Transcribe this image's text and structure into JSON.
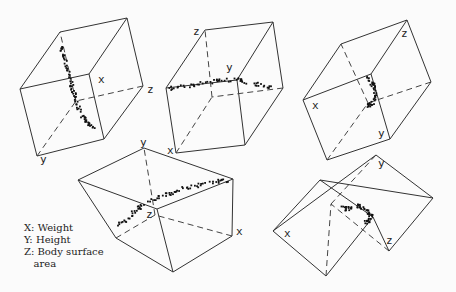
{
  "legend": {
    "x": "X: Weight",
    "y": "Y: Height",
    "z": "Z: Body surface",
    "z_cont": "   area"
  },
  "chart_data": {
    "type": "scatter",
    "title": "",
    "axes": {
      "x": "Weight",
      "y": "Height",
      "z": "Body surface area"
    },
    "legend_position": "lower-left",
    "grid": false,
    "views": [
      {
        "id": "top-left",
        "labels": {
          "x": "x",
          "y": "y",
          "z": "z"
        },
        "front": [
          [
            20,
            89
          ],
          [
            89,
            74
          ],
          [
            104,
            139
          ],
          [
            37,
            156
          ]
        ],
        "back": [
          [
            60,
            32
          ],
          [
            127,
            18
          ],
          [
            143,
            86
          ],
          [
            76,
            101
          ]
        ],
        "label_pos": {
          "x": [
            98,
            83
          ],
          "z": [
            147,
            93
          ],
          "y": [
            40,
            163
          ]
        },
        "points_path": [
          [
            60,
            46
          ],
          [
            62,
            52
          ],
          [
            64,
            60
          ],
          [
            67,
            70
          ],
          [
            70,
            80
          ],
          [
            72,
            88
          ],
          [
            74,
            96
          ],
          [
            77,
            104
          ],
          [
            80,
            112
          ],
          [
            84,
            118
          ],
          [
            88,
            124
          ],
          [
            94,
            128
          ]
        ]
      },
      {
        "id": "top-center",
        "labels": {
          "x": "x",
          "y": "y",
          "z": "z"
        },
        "front": [
          [
            166,
            88
          ],
          [
            237,
            80
          ],
          [
            245,
            145
          ],
          [
            176,
            153
          ]
        ],
        "back": [
          [
            205,
            30
          ],
          [
            273,
            22
          ],
          [
            283,
            88
          ],
          [
            212,
            97
          ]
        ],
        "label_pos": {
          "x": [
            167,
            154
          ],
          "y": [
            226,
            71
          ],
          "z": [
            193,
            35
          ]
        },
        "points_path": [
          [
            168,
            88
          ],
          [
            180,
            86
          ],
          [
            192,
            84
          ],
          [
            205,
            82
          ],
          [
            218,
            80
          ],
          [
            230,
            79
          ],
          [
            240,
            80
          ],
          [
            250,
            82
          ],
          [
            262,
            85
          ],
          [
            272,
            88
          ]
        ]
      },
      {
        "id": "top-right",
        "labels": {
          "x": "x",
          "y": "y",
          "z": "z"
        },
        "front": [
          [
            303,
            100
          ],
          [
            371,
            74
          ],
          [
            390,
            139
          ],
          [
            327,
            160
          ]
        ],
        "back": [
          [
            341,
            44
          ],
          [
            407,
            20
          ],
          [
            431,
            82
          ],
          [
            368,
            103
          ]
        ],
        "label_pos": {
          "x": [
            312,
            109
          ],
          "z": [
            401,
            37
          ],
          "y": [
            378,
            137
          ]
        },
        "points_path": [
          [
            366,
            76
          ],
          [
            371,
            82
          ],
          [
            374,
            88
          ],
          [
            375,
            94
          ],
          [
            373,
            100
          ],
          [
            369,
            104
          ],
          [
            367,
            108
          ]
        ]
      },
      {
        "id": "bottom-center",
        "labels": {
          "x": "x",
          "y": "y",
          "z": "z"
        },
        "front": [
          [
            78,
            180
          ],
          [
            157,
            209
          ],
          [
            173,
            272
          ],
          [
            116,
            238
          ]
        ],
        "back": [
          [
            144,
            148
          ],
          [
            233,
            179
          ],
          [
            232,
            236
          ],
          [
            155,
            215
          ]
        ],
        "label_pos": {
          "y": [
            140,
            146
          ],
          "z": [
            146,
            218
          ],
          "x": [
            236,
            235
          ]
        },
        "points_path": [
          [
            116,
            226
          ],
          [
            124,
            220
          ],
          [
            132,
            212
          ],
          [
            140,
            206
          ],
          [
            150,
            200
          ],
          [
            160,
            196
          ],
          [
            170,
            192
          ],
          [
            180,
            188
          ],
          [
            192,
            186
          ],
          [
            205,
            183
          ],
          [
            218,
            180
          ],
          [
            230,
            179
          ]
        ]
      },
      {
        "id": "bottom-right",
        "labels": {
          "x": "x",
          "y": "y",
          "z": "z"
        },
        "front": [
          [
            273,
            231
          ],
          [
            320,
            180
          ],
          [
            373,
            217
          ],
          [
            326,
            276
          ]
        ],
        "back": [
          [
            376,
            155
          ],
          [
            433,
            198
          ],
          [
            389,
            251
          ],
          [
            331,
            204
          ]
        ],
        "label_pos": {
          "x": [
            284,
            237
          ],
          "y": [
            378,
            167
          ],
          "z": [
            386,
            244
          ]
        },
        "points_path": [
          [
            340,
            207
          ],
          [
            346,
            208
          ],
          [
            352,
            206
          ],
          [
            358,
            205
          ],
          [
            364,
            207
          ],
          [
            368,
            212
          ],
          [
            370,
            216
          ],
          [
            368,
            220
          ],
          [
            364,
            222
          ]
        ]
      }
    ]
  }
}
